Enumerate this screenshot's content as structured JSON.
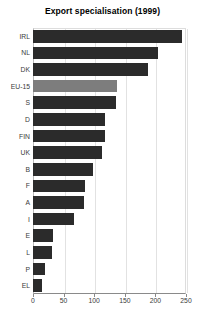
{
  "chart_data": {
    "type": "bar",
    "orientation": "horizontal",
    "title": "Export specialisation (1999)",
    "xlabel": "",
    "ylabel": "",
    "xlim": [
      0,
      250
    ],
    "xticks": [
      0,
      50,
      100,
      150,
      200,
      250
    ],
    "grid": true,
    "legend": "none",
    "categories": [
      "IRL",
      "NL",
      "DK",
      "EU-15",
      "S",
      "D",
      "FIN",
      "UK",
      "B",
      "F",
      "A",
      "I",
      "E",
      "L",
      "P",
      "EL"
    ],
    "values": [
      243,
      204,
      188,
      137,
      136,
      118,
      118,
      113,
      98,
      85,
      83,
      67,
      33,
      31,
      20,
      15
    ],
    "highlight_category": "EU-15",
    "colors": {
      "bar": "#2b2b2b",
      "bar_highlight": "#7d7d7d",
      "grid": "#e2e2e2",
      "axis": "#8a8a8a",
      "text": "#3a3a3a",
      "title": "#000000",
      "background": "#ffffff"
    }
  }
}
